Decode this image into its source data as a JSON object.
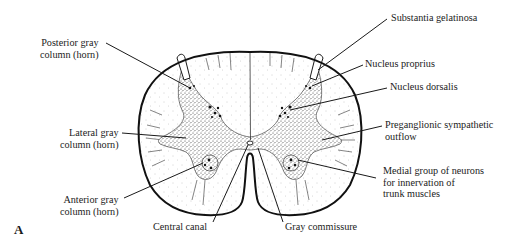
{
  "figure": {
    "panel_letter": "A"
  },
  "labels_left": [
    {
      "id": "posterior-gray-column",
      "text": "Posterior gray\ncolumn (horn)"
    },
    {
      "id": "lateral-gray-column",
      "text": "Lateral gray\ncolumn (horn)"
    },
    {
      "id": "anterior-gray-column",
      "text": "Anterior gray\ncolumn (horn)"
    }
  ],
  "labels_bottom": [
    {
      "id": "central-canal",
      "text": "Central canal"
    },
    {
      "id": "gray-commissure",
      "text": "Gray commissure"
    }
  ],
  "labels_right": [
    {
      "id": "substantia-gelatinosa",
      "text": "Substantia gelatinosa"
    },
    {
      "id": "nucleus-proprius",
      "text": "Nucleus proprius"
    },
    {
      "id": "nucleus-dorsalis",
      "text": "Nucleus dorsalis"
    },
    {
      "id": "preganglionic-sympathetic-outflow",
      "text": "Preganglionic sympathetic\noutflow"
    },
    {
      "id": "medial-group-neurons",
      "text": "Medial group of neurons\nfor innervation of\ntrunk muscles"
    }
  ],
  "colors": {
    "ink": "#1a1a1a",
    "gray_matter_stipple": "#3a3a3a",
    "white_matter_dot": "#9a9a9a",
    "background": "#ffffff"
  }
}
